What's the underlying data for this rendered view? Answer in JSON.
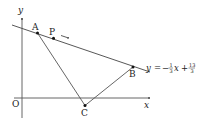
{
  "diagram": {
    "axes": {
      "x_label": "x",
      "y_label": "y",
      "origin_label": "O"
    },
    "points": {
      "A": "A",
      "P": "P",
      "B": "B",
      "C": "C"
    },
    "line_equation": {
      "lhs": "y",
      "equals": "=",
      "sign": "−",
      "coef_num": "1",
      "coef_den": "3",
      "var": "x",
      "plus": "+",
      "const_num": "13",
      "const_den": "3"
    },
    "colors": {
      "line": "#333333",
      "point": "#111111"
    }
  }
}
